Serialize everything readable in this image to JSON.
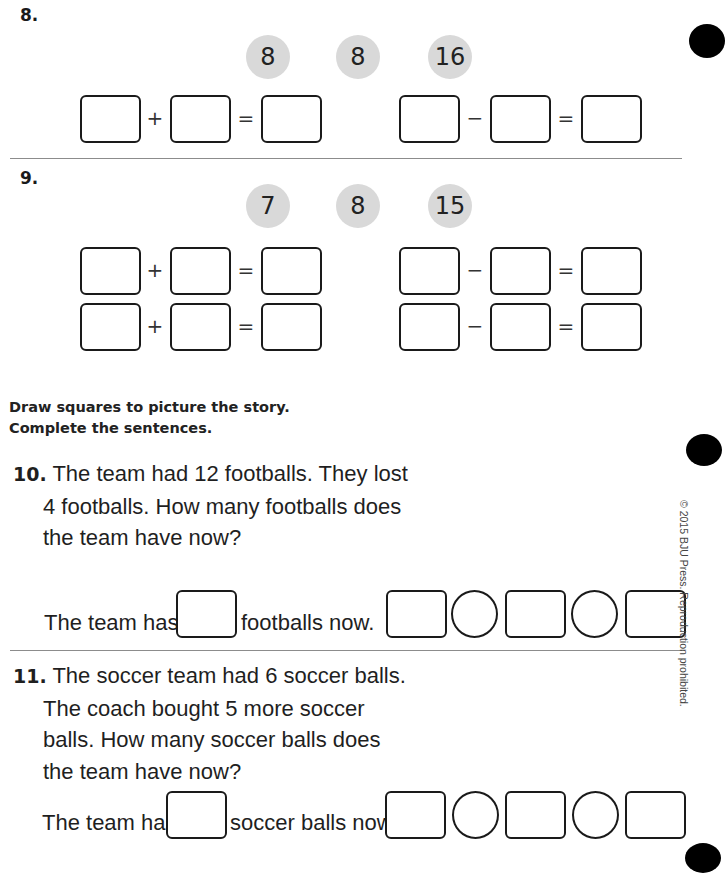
{
  "problems": {
    "p8": {
      "label": "8.",
      "numbers": [
        "8",
        "8",
        "16"
      ],
      "addition_rows": [
        {
          "op": "+",
          "eq": "="
        }
      ],
      "subtraction_rows": [
        {
          "op": "−",
          "eq": "="
        }
      ]
    },
    "p9": {
      "label": "9.",
      "numbers": [
        "7",
        "8",
        "15"
      ],
      "addition_rows": [
        {
          "op": "+",
          "eq": "="
        },
        {
          "op": "+",
          "eq": "="
        }
      ],
      "subtraction_rows": [
        {
          "op": "−",
          "eq": "="
        },
        {
          "op": "−",
          "eq": "="
        }
      ]
    }
  },
  "instructions": {
    "line1": "Draw squares to picture the story.",
    "line2": "Complete the sentences."
  },
  "story_problems": [
    {
      "label": "10.",
      "lines": [
        "The team had 12 footballs. They lost",
        "4 footballs. How many footballs does",
        "the team have now?"
      ],
      "sentence_before": "The team has",
      "sentence_after": "footballs now."
    },
    {
      "label": "11.",
      "lines": [
        "The soccer team had 6 soccer balls.",
        "The coach bought 5 more soccer",
        "balls. How many soccer balls does",
        "the team have now?"
      ],
      "sentence_before": "The team has",
      "sentence_after": "soccer balls now."
    }
  ],
  "footer": {
    "copyright": "© 2015 BJU Press. Reproduction prohibited."
  },
  "colors": {
    "number_circle": "#d9d9d9",
    "divider": "#8c8c8c",
    "ink": "#1a1a1a"
  }
}
